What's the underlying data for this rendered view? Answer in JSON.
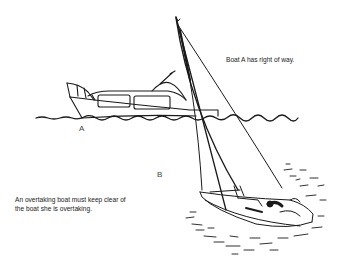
{
  "diagram": {
    "type": "illustration",
    "captions": {
      "right_of_way": "Boat A has right of way.",
      "overtaking_line1": "An overtaking boat must keep clear of",
      "overtaking_line2": "the boat she is overtaking."
    },
    "labels": {
      "boat_a": "A",
      "boat_b": "B"
    },
    "boats": [
      {
        "id": "A",
        "kind": "motor cruiser"
      },
      {
        "id": "B",
        "kind": "sailing yacht (heeled)"
      }
    ],
    "colors": {
      "ink": "#1a1a1a",
      "background": "#ffffff"
    }
  }
}
